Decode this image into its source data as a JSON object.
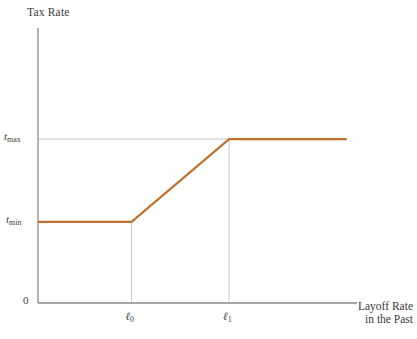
{
  "figure": {
    "background_color": "#ffffff",
    "axis_color": "#8a8a8a",
    "guide_color": "#b9b9b9",
    "curve_color": "#c0702b",
    "text_color": "#3a3a3a"
  },
  "axes": {
    "y_title": "Tax Rate",
    "x_title_line1": "Layoff Rate",
    "x_title_line2": "in the Past",
    "origin_label": "0",
    "y_ticks": [
      {
        "base": "t",
        "sub": "max",
        "label": "tmax"
      },
      {
        "base": "t",
        "sub": "min",
        "label": "tmin"
      }
    ],
    "x_ticks": [
      {
        "base": "ℓ",
        "sub": "0",
        "label": "ℓ0"
      },
      {
        "base": "ℓ",
        "sub": "1",
        "label": "ℓ1"
      }
    ]
  },
  "chart_data": {
    "type": "line",
    "title": "",
    "xlabel": "Layoff Rate in the Past",
    "ylabel": "Tax Rate",
    "grid": false,
    "legend": "none",
    "x_tick_labels": [
      "ℓ0",
      "ℓ1"
    ],
    "y_tick_labels": [
      "0",
      "tmin",
      "tmax"
    ],
    "xlim": [
      0,
      1
    ],
    "ylim": [
      0,
      1
    ],
    "annotations": [
      "horizontal guide line at tmax from y-axis to the kink at ℓ1",
      "vertical guide line at ℓ0 down to x-axis",
      "vertical guide line at ℓ1 down to x-axis"
    ],
    "series": [
      {
        "name": "Experience-rated tax schedule",
        "color": "#c0702b",
        "description": "Piecewise linear: flat at tmin until ℓ0, rising linearly to tmax at ℓ1, then flat at tmax",
        "points": [
          {
            "x": 0.0,
            "y": 0.295,
            "x_label": "0",
            "y_label": "tmin"
          },
          {
            "x": 0.293,
            "y": 0.295,
            "x_label": "ℓ0",
            "y_label": "tmin"
          },
          {
            "x": 0.599,
            "y": 0.596,
            "x_label": "ℓ1",
            "y_label": "tmax"
          },
          {
            "x": 0.968,
            "y": 0.596,
            "x_label": "",
            "y_label": "tmax"
          }
        ]
      }
    ]
  }
}
